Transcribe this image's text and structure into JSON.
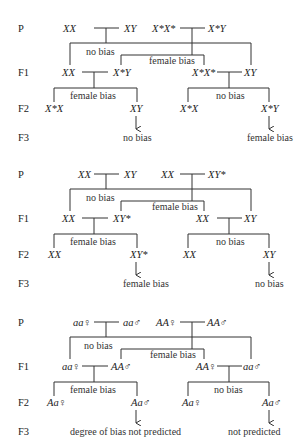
{
  "rows": [
    "P",
    "F1",
    "F2",
    "F3"
  ],
  "diagrams": [
    {
      "p_left_female": "XX",
      "p_left_male": "XY",
      "p_right_female": "X*X*",
      "p_right_male": "X*Y",
      "p_left_note": "no bias",
      "p_right_note": "female bias",
      "f1_left_female": "XX",
      "f1_left_male": "X*Y",
      "f1_right_female": "X*X*",
      "f1_right_male": "XY",
      "f1_left_note": "female bias",
      "f1_right_note": "no bias",
      "f2_left_female": "X*X",
      "f2_left_male": "XY",
      "f2_right_female": "X*X",
      "f2_right_male": "X*Y",
      "f3_left": "no bias",
      "f3_right": "female bias"
    },
    {
      "p_left_female": "XX",
      "p_left_male": "XY",
      "p_right_female": "XX",
      "p_right_male": "XY*",
      "p_left_note": "no bias",
      "p_right_note": "female bias",
      "f1_left_female": "XX",
      "f1_left_male": "XY*",
      "f1_right_female": "XX",
      "f1_right_male": "XY",
      "f1_left_note": "female bias",
      "f1_right_note": "no bias",
      "f2_left_female": "XX",
      "f2_left_male": "XY*",
      "f2_right_female": "XX",
      "f2_right_male": "XY",
      "f3_left": "female bias",
      "f3_right": "no bias"
    },
    {
      "p_left_female": "aa♀",
      "p_left_male": "aa♂",
      "p_right_female": "AA♀",
      "p_right_male": "AA♂",
      "p_left_note": "no bias",
      "p_right_note": "female bias",
      "f1_left_female": "aa♀",
      "f1_left_male": "AA♂",
      "f1_right_female": "AA♀",
      "f1_right_male": "aa♂",
      "f1_left_note": "female bias",
      "f1_right_note": "no bias",
      "f2_left_female": "Aa♀",
      "f2_left_male": "Aa♂",
      "f2_right_female": "Aa♀",
      "f2_right_male": "Aa♂",
      "f3_left": "degree of bias not predicted",
      "f3_right": "not predicted"
    }
  ]
}
